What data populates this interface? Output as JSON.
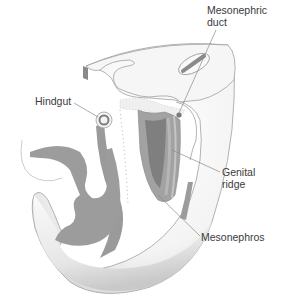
{
  "figure": {
    "labels": [
      {
        "id": "mesonephric-duct",
        "lines": [
          "Mesonephric",
          "duct"
        ],
        "x": 207,
        "y": 4
      },
      {
        "id": "hindgut",
        "lines": [
          "Hindgut"
        ],
        "x": 35,
        "y": 95
      },
      {
        "id": "genital-ridge",
        "lines": [
          "Genital",
          "ridge"
        ],
        "x": 222,
        "y": 168
      },
      {
        "id": "mesonephros",
        "lines": [
          "Mesonephros"
        ],
        "x": 201,
        "y": 231
      }
    ],
    "colors": {
      "tissue_dark": "#8e8e8e",
      "tissue_mid": "#a8a8a8",
      "tissue_light": "#f2f2f2",
      "outline": "#9a9a9a",
      "leader": "#8a8a8a",
      "text": "#3a3a3a"
    }
  }
}
